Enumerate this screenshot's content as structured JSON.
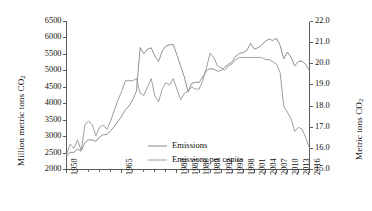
{
  "chart_data": {
    "type": "line",
    "title": "",
    "xlabel": "",
    "ylabel": "Million metric tons CO2",
    "y2label": "Metric tons CO2",
    "grid": false,
    "legend_position": "inside lower-left",
    "ylim": [
      2000,
      6500
    ],
    "y2lim": [
      15.0,
      22.0
    ],
    "xlim": [
      1950,
      2016
    ],
    "yticks": [
      2000,
      2500,
      3000,
      3500,
      4000,
      4500,
      5000,
      5500,
      6000,
      6500
    ],
    "y2ticks": [
      "15.0",
      "16.0",
      "17.0",
      "18.0",
      "19.0",
      "20.0",
      "21.0",
      "22.0"
    ],
    "xticklabels": [
      "1950",
      "1965",
      "1980",
      "1983",
      "1986",
      "1989",
      "1992",
      "1995",
      "1998",
      "2001",
      "2004",
      "2007",
      "2010",
      "2013",
      "2016"
    ],
    "xtickyears": [
      1950,
      1965,
      1980,
      1983,
      1986,
      1989,
      1992,
      1995,
      1998,
      2001,
      2004,
      2007,
      2010,
      2013,
      2016
    ],
    "x": [
      1950,
      1951,
      1952,
      1953,
      1954,
      1955,
      1956,
      1957,
      1958,
      1959,
      1960,
      1961,
      1962,
      1963,
      1964,
      1965,
      1966,
      1967,
      1968,
      1969,
      1970,
      1971,
      1972,
      1973,
      1974,
      1975,
      1976,
      1977,
      1978,
      1979,
      1980,
      1981,
      1982,
      1983,
      1984,
      1985,
      1986,
      1987,
      1988,
      1989,
      1990,
      1991,
      1992,
      1993,
      1994,
      1995,
      1996,
      1997,
      1998,
      1999,
      2000,
      2001,
      2002,
      2003,
      2004,
      2005,
      2006,
      2007,
      2008,
      2009,
      2010,
      2011,
      2012,
      2013,
      2014,
      2015,
      2016
    ],
    "series": [
      {
        "name": "Emissions",
        "axis": "left",
        "unit": "Million metric tons CO2",
        "color": "#8a8a8a",
        "values": [
          2410,
          2520,
          2520,
          2620,
          2560,
          2820,
          2900,
          2900,
          2860,
          2990,
          3060,
          3060,
          3180,
          3320,
          3470,
          3620,
          3820,
          3930,
          4130,
          4380,
          5710,
          5520,
          5660,
          5700,
          5450,
          5280,
          5600,
          5760,
          5790,
          5800,
          5480,
          5140,
          4820,
          4360,
          4620,
          4650,
          4650,
          4810,
          5000,
          5070,
          5050,
          4990,
          5010,
          5110,
          5200,
          5270,
          5450,
          5530,
          5560,
          5620,
          5840,
          5660,
          5700,
          5780,
          5900,
          5970,
          5920,
          5990,
          5780,
          5370,
          5570,
          5410,
          5150,
          5290,
          5290,
          5190,
          5010
        ]
      },
      {
        "name": "Emissions per capita",
        "axis": "right",
        "unit": "Metric tons CO2",
        "color": "#9a9a9a",
        "values": [
          15.7,
          16.2,
          16.0,
          16.4,
          15.9,
          17.1,
          17.3,
          17.1,
          16.6,
          17.0,
          17.1,
          16.9,
          17.3,
          17.8,
          18.3,
          18.7,
          19.2,
          19.2,
          19.2,
          19.3,
          18.6,
          18.5,
          18.9,
          19.3,
          18.5,
          18.2,
          18.8,
          19.1,
          19.0,
          19.3,
          18.8,
          18.3,
          18.6,
          18.7,
          18.9,
          18.8,
          18.8,
          19.2,
          19.8,
          20.5,
          20.3,
          19.9,
          19.8,
          19.7,
          19.9,
          20.0,
          20.2,
          20.3,
          20.3,
          20.3,
          20.3,
          20.3,
          20.3,
          20.3,
          20.2,
          20.2,
          20.1,
          20.0,
          19.6,
          18.0,
          17.7,
          17.4,
          16.8,
          17.0,
          16.9,
          16.5,
          16.0
        ]
      }
    ]
  },
  "legend": {
    "entries": [
      {
        "label": "Emissions"
      },
      {
        "label": "Emissions per capita"
      }
    ]
  },
  "axes": {
    "left_title_text": "Million metric tons CO",
    "left_title_sub": "2",
    "right_title_text": "Metric tons CO",
    "right_title_sub": "2"
  }
}
